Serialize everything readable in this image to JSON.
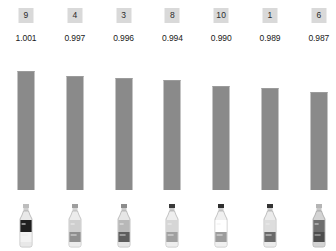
{
  "chart_data": {
    "type": "bar",
    "title": "",
    "subtitle": "",
    "xlabel": "",
    "ylabel": "",
    "grid": false,
    "legend": "none",
    "categories": [
      "9",
      "4",
      "3",
      "8",
      "10",
      "1",
      "6"
    ],
    "values": [
      1.001,
      0.997,
      0.996,
      0.994,
      0.99,
      0.989,
      0.987
    ],
    "value_labels": [
      "1.001",
      "0.997",
      "0.996",
      "0.994",
      "0.990",
      "0.989",
      "0.987"
    ],
    "ylim": [
      0.0,
      1.001
    ],
    "bar_pixel_heights": [
      119,
      114,
      112,
      110,
      104,
      102,
      98
    ]
  },
  "colors": {
    "background": "#ffffff",
    "bar": "#8a8a8a",
    "bar_top_edge": "#9b9b9b",
    "badge_background": "#d9d9d9",
    "badge_text": "#2b2b2b",
    "score_text": "#1a1a1a"
  },
  "columns": [
    {
      "rank_label": "9",
      "score": "1.001",
      "bar_height_px": 119,
      "thumbnail": {
        "name": "bottle-thumbnail-1",
        "description": "clear plastic bottle with dark upper label and white lower band",
        "cap": "#bdbdbd",
        "neck": "#cfcfcf",
        "body": "#e8e8e8",
        "label_upper": "#1f1f1f",
        "label_lower": "#f2f2f2",
        "outline": "#9a9a9a"
      }
    },
    {
      "rank_label": "4",
      "score": "0.997",
      "bar_height_px": 114,
      "thumbnail": {
        "name": "bottle-thumbnail-2",
        "description": "clear bottle with mid gray mottled label",
        "cap": "#9e9e9e",
        "neck": "#d4d4d4",
        "body": "#ececec",
        "label_upper": "#cfcfcf",
        "label_lower": "#8f8f8f",
        "outline": "#a5a5a5"
      }
    },
    {
      "rank_label": "3",
      "score": "0.996",
      "bar_height_px": 112,
      "thumbnail": {
        "name": "bottle-thumbnail-3",
        "description": "tall bottle with dark diagonal label patch",
        "cap": "#8c8c8c",
        "neck": "#cbcbcb",
        "body": "#e6e6e6",
        "label_upper": "#b8b8b8",
        "label_lower": "#5d5d5d",
        "outline": "#9a9a9a"
      }
    },
    {
      "rank_label": "8",
      "score": "0.994",
      "bar_height_px": 110,
      "thumbnail": {
        "name": "bottle-thumbnail-4",
        "description": "bottle with dark cap and busy light gray label",
        "cap": "#3a3a3a",
        "neck": "#cccccc",
        "body": "#eeeeee",
        "label_upper": "#d6d6d6",
        "label_lower": "#a0a0a0",
        "outline": "#9f9f9f"
      }
    },
    {
      "rank_label": "10",
      "score": "0.990",
      "bar_height_px": 104,
      "thumbnail": {
        "name": "bottle-thumbnail-5",
        "description": "short bottle with dark cap and white label with gray marks",
        "cap": "#2f2f2f",
        "neck": "#d0d0d0",
        "body": "#f0f0f0",
        "label_upper": "#ffffff",
        "label_lower": "#9c9c9c",
        "outline": "#a3a3a3"
      }
    },
    {
      "rank_label": "1",
      "score": "0.989",
      "bar_height_px": 102,
      "thumbnail": {
        "name": "bottle-thumbnail-6",
        "description": "bottle with dark cap and dark lower body band",
        "cap": "#343434",
        "neck": "#cdcdcd",
        "body": "#ebebeb",
        "label_upper": "#dddddd",
        "label_lower": "#6a6a6a",
        "outline": "#9c9c9c"
      }
    },
    {
      "rank_label": "6",
      "score": "0.987",
      "bar_height_px": 98,
      "thumbnail": {
        "name": "bottle-thumbnail-7",
        "description": "dark filled bottle with gray highlights",
        "cap": "#b5b5b5",
        "neck": "#c7c7c7",
        "body": "#d3d3d3",
        "label_upper": "#6e6e6e",
        "label_lower": "#4d4d4d",
        "outline": "#8f8f8f"
      }
    }
  ]
}
